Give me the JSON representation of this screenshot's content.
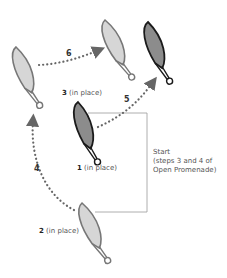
{
  "colors": {
    "light_fill": "#d6d6d6",
    "light_stroke": "#777777",
    "dark_fill": "#8c8c8c",
    "dark_stroke": "#1a1a1a",
    "arrow": "#666666",
    "frame": "#999999"
  },
  "pieces": [
    {
      "id": "top-left",
      "label_num": "",
      "label": "",
      "shade": "light"
    },
    {
      "id": "top-middle",
      "label_num": "",
      "label": "",
      "shade": "light"
    },
    {
      "id": "top-right",
      "label_num": "",
      "label": "",
      "shade": "dark"
    },
    {
      "id": "center",
      "label_num": "1",
      "label": "(in place)",
      "shade": "dark"
    },
    {
      "id": "bottom",
      "label_num": "2",
      "label": "(in place)",
      "shade": "light"
    }
  ],
  "labels": {
    "piece3_num": "3",
    "piece3_text": "(in place)",
    "piece1_num": "1",
    "piece1_text": "(in place)",
    "piece2_num": "2",
    "piece2_text": "(in place)"
  },
  "arrows": [
    {
      "step": "4",
      "from": "bottom",
      "to": "top-left"
    },
    {
      "step": "5",
      "from": "center",
      "to": "top-right"
    },
    {
      "step": "6",
      "from": "top-left",
      "to": "top-middle"
    }
  ],
  "arrow_labels": {
    "a4": "4",
    "a5": "5",
    "a6": "6"
  },
  "note": {
    "line1": "Start",
    "line2": "(steps 3 and 4 of",
    "line3": "Open Promenade)"
  }
}
